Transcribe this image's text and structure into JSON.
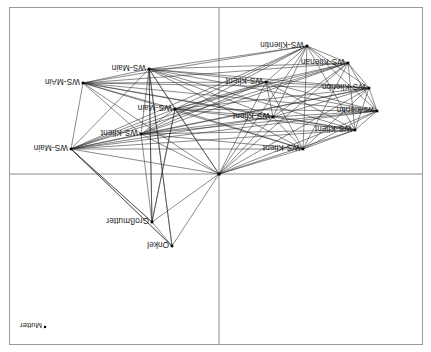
{
  "figure": {
    "title": "",
    "background_color": "#ffffff",
    "frame_color": "#9a9a9a",
    "axis_color": "#8c8c8c",
    "edge_color": "#2b2b2b",
    "node_color": "#000000",
    "label_rotation_degrees": 180,
    "width": 431,
    "height": 352
  },
  "chart_data": {
    "type": "scatter",
    "title": "",
    "xlabel": "",
    "ylabel": "",
    "xlim": [
      -1,
      1
    ],
    "ylim": [
      -1,
      1
    ],
    "grid": false,
    "legend": "none",
    "axes": {
      "vertical_axis_x": 219,
      "horizontal_axis_y": 174
    },
    "nodes": [
      {
        "label": "WS-MAin",
        "x": 83,
        "y": 83,
        "lx": 80,
        "ly": 79,
        "anchor": "right",
        "size": 2.6
      },
      {
        "label": "WS-Main",
        "x": 149,
        "y": 69,
        "lx": 146,
        "ly": 65,
        "anchor": "right",
        "size": 2.6
      },
      {
        "label": "WS-Main",
        "x": 71,
        "y": 149,
        "lx": 68,
        "ly": 145,
        "anchor": "right",
        "size": 2.6
      },
      {
        "label": "WS-Klient",
        "x": 141,
        "y": 134,
        "lx": 138,
        "ly": 130,
        "anchor": "right",
        "size": 2.6
      },
      {
        "label": "WS-Main",
        "x": 175,
        "y": 109,
        "lx": 172,
        "ly": 105,
        "anchor": "right",
        "size": 2.6
      },
      {
        "label": "WS-Klient",
        "x": 266,
        "y": 82,
        "lx": 263,
        "ly": 78,
        "anchor": "right",
        "size": 2.6
      },
      {
        "label": "WS-Klient",
        "x": 273,
        "y": 117,
        "lx": 270,
        "ly": 113,
        "anchor": "right",
        "size": 2.6
      },
      {
        "label": "WS-Klientin",
        "x": 307,
        "y": 46,
        "lx": 304,
        "ly": 42,
        "anchor": "right",
        "size": 2.6
      },
      {
        "label": "WS-Klienan",
        "x": 348,
        "y": 63,
        "lx": 345,
        "ly": 59,
        "anchor": "right",
        "size": 2.6
      },
      {
        "label": "WS-Klienbn",
        "x": 369,
        "y": 88,
        "lx": 366,
        "ly": 84,
        "anchor": "right",
        "size": 2.6
      },
      {
        "label": "ws-kientin",
        "x": 377,
        "y": 111,
        "lx": 374,
        "ly": 107,
        "anchor": "right",
        "size": 2.6
      },
      {
        "label": "WS-Klient",
        "x": 355,
        "y": 130,
        "lx": 352,
        "ly": 126,
        "anchor": "right",
        "size": 2.6
      },
      {
        "label": "WS-Klient",
        "x": 303,
        "y": 149,
        "lx": 300,
        "ly": 145,
        "anchor": "right",
        "size": 2.6
      },
      {
        "label": "Großmutter",
        "x": 152,
        "y": 222,
        "lx": 149,
        "ly": 218,
        "anchor": "right",
        "size": 2.6
      },
      {
        "label": "Onkel",
        "x": 172,
        "y": 246,
        "lx": 169,
        "ly": 242,
        "anchor": "right",
        "size": 2.6
      },
      {
        "label": "Mutter",
        "x": 45,
        "y": 327,
        "lx": 42,
        "ly": 323,
        "anchor": "right",
        "size": 2.2
      },
      {
        "label": "",
        "x": 219,
        "y": 174,
        "lx": 219,
        "ly": 174,
        "anchor": "right",
        "size": 3.0
      }
    ],
    "edges": [
      [
        0,
        1
      ],
      [
        0,
        2
      ],
      [
        0,
        3
      ],
      [
        0,
        4
      ],
      [
        0,
        5
      ],
      [
        0,
        6
      ],
      [
        0,
        7
      ],
      [
        0,
        8
      ],
      [
        0,
        9
      ],
      [
        0,
        10
      ],
      [
        0,
        11
      ],
      [
        0,
        12
      ],
      [
        0,
        16
      ],
      [
        1,
        2
      ],
      [
        1,
        3
      ],
      [
        1,
        4
      ],
      [
        1,
        5
      ],
      [
        1,
        6
      ],
      [
        1,
        7
      ],
      [
        1,
        8
      ],
      [
        1,
        9
      ],
      [
        1,
        10
      ],
      [
        1,
        11
      ],
      [
        1,
        12
      ],
      [
        1,
        13
      ],
      [
        1,
        14
      ],
      [
        1,
        16
      ],
      [
        2,
        3
      ],
      [
        2,
        4
      ],
      [
        2,
        5
      ],
      [
        2,
        6
      ],
      [
        2,
        7
      ],
      [
        2,
        8
      ],
      [
        2,
        9
      ],
      [
        2,
        10
      ],
      [
        2,
        11
      ],
      [
        2,
        12
      ],
      [
        2,
        13
      ],
      [
        2,
        14
      ],
      [
        2,
        16
      ],
      [
        3,
        4
      ],
      [
        3,
        5
      ],
      [
        3,
        6
      ],
      [
        3,
        7
      ],
      [
        3,
        8
      ],
      [
        3,
        9
      ],
      [
        3,
        10
      ],
      [
        3,
        11
      ],
      [
        3,
        12
      ],
      [
        3,
        13
      ],
      [
        3,
        16
      ],
      [
        4,
        5
      ],
      [
        4,
        6
      ],
      [
        4,
        7
      ],
      [
        4,
        8
      ],
      [
        4,
        9
      ],
      [
        4,
        10
      ],
      [
        4,
        11
      ],
      [
        4,
        12
      ],
      [
        4,
        13
      ],
      [
        4,
        16
      ],
      [
        5,
        6
      ],
      [
        5,
        7
      ],
      [
        5,
        8
      ],
      [
        5,
        9
      ],
      [
        5,
        10
      ],
      [
        5,
        11
      ],
      [
        5,
        12
      ],
      [
        5,
        16
      ],
      [
        6,
        7
      ],
      [
        6,
        8
      ],
      [
        6,
        9
      ],
      [
        6,
        10
      ],
      [
        6,
        11
      ],
      [
        6,
        12
      ],
      [
        6,
        16
      ],
      [
        7,
        8
      ],
      [
        7,
        9
      ],
      [
        7,
        10
      ],
      [
        7,
        11
      ],
      [
        7,
        12
      ],
      [
        7,
        16
      ],
      [
        8,
        9
      ],
      [
        8,
        10
      ],
      [
        8,
        11
      ],
      [
        8,
        12
      ],
      [
        8,
        16
      ],
      [
        9,
        10
      ],
      [
        9,
        11
      ],
      [
        9,
        12
      ],
      [
        9,
        16
      ],
      [
        10,
        11
      ],
      [
        10,
        12
      ],
      [
        10,
        16
      ],
      [
        11,
        12
      ],
      [
        11,
        16
      ],
      [
        12,
        16
      ],
      [
        13,
        14
      ],
      [
        13,
        16
      ],
      [
        13,
        1
      ],
      [
        13,
        4
      ],
      [
        14,
        16
      ],
      [
        14,
        1
      ],
      [
        2,
        14
      ],
      [
        2,
        13
      ]
    ]
  }
}
